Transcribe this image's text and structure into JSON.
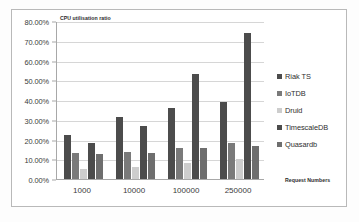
{
  "chart_data": {
    "type": "bar",
    "title": "",
    "ylabel": "CPU utilisation ratio",
    "xlabel": "Request Numbers",
    "categories": [
      "1000",
      "10000",
      "100000",
      "250000"
    ],
    "ylim": [
      0,
      80
    ],
    "ytick_labels": [
      "0.00%",
      "10.00%",
      "20.00%",
      "30.00%",
      "40.00%",
      "50.00%",
      "60.00%",
      "70.00%",
      "80.00%"
    ],
    "ytick_values": [
      0,
      10,
      20,
      30,
      40,
      50,
      60,
      70,
      80
    ],
    "grid": true,
    "legend_position": "right",
    "series": [
      {
        "name": "Riak TS",
        "color": "#4c4c4c",
        "values": [
          22.5,
          31.5,
          35.8,
          38.8
        ]
      },
      {
        "name": "IoTDB",
        "color": "#7a7a7a",
        "values": [
          13.0,
          13.8,
          15.5,
          18.0
        ]
      },
      {
        "name": "Druid",
        "color": "#cdcdcd",
        "values": [
          5.0,
          6.0,
          8.3,
          10.2
        ]
      },
      {
        "name": "TimescaleDB",
        "color": "#4c4c4c",
        "values": [
          18.0,
          26.8,
          53.2,
          74.0
        ]
      },
      {
        "name": "Quasardb",
        "color": "#6e6e6e",
        "values": [
          12.5,
          13.0,
          15.5,
          16.5
        ]
      }
    ]
  },
  "colors": {
    "plot_background": "#ffffff",
    "gridline": "#d6d6d6",
    "axis_line": "#a8a8a8",
    "frame_border": "#b9b9b9",
    "text": "#3b3b3b"
  }
}
